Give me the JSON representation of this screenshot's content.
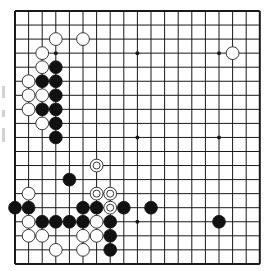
{
  "board": {
    "size": 19,
    "origin": {
      "x": 15,
      "y": 11
    },
    "spacing": {
      "x": 13.6,
      "y": 14.05
    },
    "line_color": "#1a1a1a",
    "background": "#ffffff",
    "stone_radius": 6.4,
    "star_points": [
      [
        3,
        3
      ],
      [
        9,
        3
      ],
      [
        15,
        3
      ],
      [
        3,
        9
      ],
      [
        9,
        9
      ],
      [
        15,
        9
      ],
      [
        3,
        15
      ],
      [
        9,
        15
      ],
      [
        15,
        15
      ]
    ],
    "stones": {
      "black": [
        [
          3,
          4
        ],
        [
          2,
          5
        ],
        [
          3,
          5
        ],
        [
          3,
          6
        ],
        [
          2,
          7
        ],
        [
          3,
          7
        ],
        [
          3,
          8
        ],
        [
          3,
          9
        ],
        [
          4,
          12
        ],
        [
          0,
          14
        ],
        [
          1,
          14
        ],
        [
          5,
          14
        ],
        [
          6,
          14
        ],
        [
          8,
          14
        ],
        [
          10,
          14
        ],
        [
          2,
          15
        ],
        [
          3,
          15
        ],
        [
          4,
          15
        ],
        [
          5,
          15
        ],
        [
          7,
          15
        ],
        [
          15,
          15
        ],
        [
          7,
          16
        ],
        [
          7,
          17
        ]
      ],
      "white": [
        [
          3,
          2
        ],
        [
          5,
          2
        ],
        [
          16,
          3
        ],
        [
          2,
          3
        ],
        [
          2,
          4
        ],
        [
          1,
          5
        ],
        [
          1,
          6
        ],
        [
          2,
          6
        ],
        [
          1,
          7
        ],
        [
          2,
          8
        ],
        [
          1,
          13
        ],
        [
          1,
          15
        ],
        [
          6,
          15
        ],
        [
          1,
          16
        ],
        [
          2,
          16
        ],
        [
          5,
          16
        ],
        [
          6,
          16
        ],
        [
          3,
          17
        ],
        [
          5,
          17
        ]
      ],
      "white_marked": [
        [
          6,
          11
        ],
        [
          6,
          13
        ],
        [
          7,
          13
        ],
        [
          7,
          14
        ]
      ]
    },
    "colors": {
      "black_stone": "#111111",
      "white_stone": "#ffffff",
      "stone_outline": "#222222"
    }
  },
  "margin": {
    "marks": [
      {
        "y": 86,
        "h": 12
      },
      {
        "y": 110,
        "h": 7
      },
      {
        "y": 128,
        "h": 14
      }
    ]
  }
}
